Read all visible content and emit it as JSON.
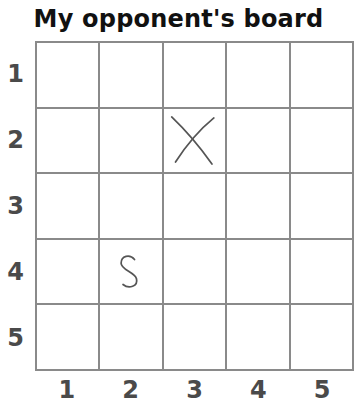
{
  "title": "My opponent's board",
  "board": {
    "rows": 5,
    "cols": 5,
    "row_labels": [
      "1",
      "2",
      "3",
      "4",
      "5"
    ],
    "col_labels": [
      "1",
      "2",
      "3",
      "4",
      "5"
    ],
    "line_color": "#8a8a8a",
    "mark_color": "#555555",
    "marks": [
      {
        "row": 2,
        "col": 3,
        "symbol": "X",
        "icon": "x-mark-icon"
      },
      {
        "row": 4,
        "col": 2,
        "symbol": "S",
        "icon": "s-mark-icon"
      }
    ]
  }
}
